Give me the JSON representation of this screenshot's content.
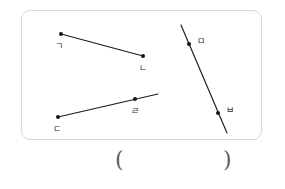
{
  "figure": {
    "caption": "",
    "viewbox": {
      "width": 241,
      "height": 130
    },
    "objects": [
      {
        "name": "segment-gieuk-nieun",
        "kind": "segment",
        "labels": [
          "ㄱ",
          "ㄴ"
        ],
        "endpoints": [
          {
            "x": 39,
            "y": 23
          },
          {
            "x": 121,
            "y": 45
          }
        ],
        "draw": {
          "x1": 39,
          "y1": 23,
          "x2": 121,
          "y2": 45
        },
        "points": [
          {
            "label": "ㄱ",
            "x": 39,
            "y": 23,
            "label_x": 33,
            "label_y": 35
          },
          {
            "label": "ㄴ",
            "x": 121,
            "y": 45,
            "label_x": 117,
            "label_y": 57
          }
        ]
      },
      {
        "name": "ray-digeut-rieul",
        "kind": "ray",
        "labels": [
          "ㄷ",
          "ㄹ"
        ],
        "endpoints": [
          {
            "x": 36,
            "y": 106
          },
          {
            "x": 113,
            "y": 88
          }
        ],
        "draw": {
          "x1": 36,
          "y1": 106,
          "x2": 136,
          "y2": 83
        },
        "points": [
          {
            "label": "ㄷ",
            "x": 36,
            "y": 106,
            "label_x": 31,
            "label_y": 118
          },
          {
            "label": "ㄹ",
            "x": 113,
            "y": 88,
            "label_x": 109,
            "label_y": 100
          }
        ]
      },
      {
        "name": "line-mieum-bieup",
        "kind": "line",
        "labels": [
          "ㅁ",
          "ㅂ"
        ],
        "endpoints": [
          {
            "x": 167,
            "y": 33
          },
          {
            "x": 196,
            "y": 102
          }
        ],
        "draw": {
          "x1": 159,
          "y1": 14,
          "x2": 205,
          "y2": 122
        },
        "points": [
          {
            "label": "ㅁ",
            "x": 167,
            "y": 33,
            "label_x": 175,
            "label_y": 30
          },
          {
            "label": "ㅂ",
            "x": 196,
            "y": 102,
            "label_x": 204,
            "label_y": 99
          }
        ]
      }
    ]
  },
  "answer": {
    "open_paren": "(",
    "close_paren": ")",
    "value": "",
    "placeholder": ""
  },
  "colors": {
    "line": "#1b1b1b",
    "point": "#141414",
    "label": "#2a2a2a",
    "card_border": "#d8d8d8",
    "paren": "#5d5d5d",
    "background": "#ffffff"
  }
}
